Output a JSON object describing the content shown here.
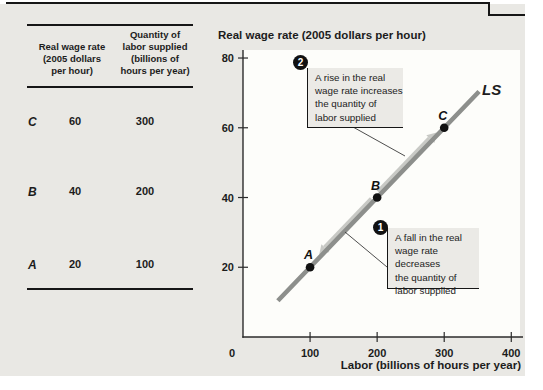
{
  "colors": {
    "card_bg": "#e9e8e4",
    "plot_bg": "#fdfdfa",
    "ink": "#1c1c1c",
    "axis": "#2b2b2b",
    "curve": "#8d8f8c",
    "arrow": "#c8c9c5",
    "callout_bg": "#ebeae6",
    "dot": "#111111"
  },
  "table": {
    "col1_header": "Real wage rate\n(2005 dollars\nper hour)",
    "col2_header": "Quantity of\nlabor supplied\n(billions of\nhours per year)",
    "rows": [
      {
        "label": "C",
        "wage": "60",
        "quantity": "300"
      },
      {
        "label": "B",
        "wage": "40",
        "quantity": "200"
      },
      {
        "label": "A",
        "wage": "20",
        "quantity": "100"
      }
    ]
  },
  "chart_data": {
    "type": "line",
    "title": "Real wage rate (2005 dollars per hour)",
    "xlabel": "Labor (billions of hours per year)",
    "ylabel": "Real wage rate (2005 dollars per hour)",
    "xlim": [
      0,
      413
    ],
    "ylim": [
      0,
      82.3
    ],
    "x_ticks": [
      0,
      100,
      200,
      300,
      400
    ],
    "y_ticks": [
      20,
      40,
      60,
      80
    ],
    "grid": false,
    "series": [
      {
        "name": "LS",
        "points": [
          [
            52,
            10.4
          ],
          [
            100,
            20
          ],
          [
            200,
            40
          ],
          [
            300,
            60
          ],
          [
            352,
            70.4
          ]
        ]
      }
    ],
    "points": [
      {
        "label": "A",
        "x": 100,
        "y": 20
      },
      {
        "label": "B",
        "x": 200,
        "y": 40
      },
      {
        "label": "C",
        "x": 300,
        "y": 60
      }
    ],
    "curve_label": "LS",
    "arrows": [
      {
        "name": "rise-arrow",
        "from": [
          205,
          41
        ],
        "to": [
          291,
          58.2
        ]
      },
      {
        "name": "fall-arrow",
        "from": [
          195,
          39
        ],
        "to": [
          116,
          23.2
        ]
      }
    ],
    "annotations": [
      {
        "number": "2",
        "text": "A rise in the real\nwage rate increases\nthe quantity of\nlabor supplied"
      },
      {
        "number": "1",
        "text": "A fall in the real\nwage rate decreases\nthe quantity of\nlabor supplied"
      }
    ]
  }
}
